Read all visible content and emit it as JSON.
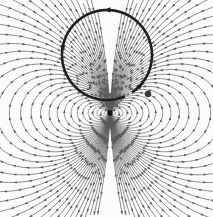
{
  "figure": {
    "title": "Magnetic field of a circular current loop (dipole field)",
    "width": 213,
    "height": 217,
    "background_color": "#fbfbfa",
    "line_color": "#5a5a5a",
    "heavy_line_color": "#1a1a1a",
    "marker_color": "#111111"
  },
  "current_loop": {
    "name": "current-loop",
    "center_x": 107,
    "center_y": 55,
    "radius": 45,
    "stroke_width": 2.6,
    "color": "#1f1f1f",
    "gap_start_deg": 55,
    "gap_end_deg": 68,
    "direction": "clockwise-viewed-from-front",
    "arrow_count": 3,
    "arrow_angles_deg": [
      268,
      186,
      40
    ]
  },
  "dipole_marker": {
    "name": "dipole-center-marker",
    "x": 110,
    "y": 113,
    "size": 5,
    "shape": "square",
    "color": "#111111"
  },
  "loop_end_marker": {
    "name": "loop-end-cap",
    "x": 148,
    "y": 94,
    "radius": 3.2,
    "color": "#3a3a3a"
  },
  "field_lines": {
    "name": "magnetic-field-lines",
    "stroke_width": 0.75,
    "color": "#5b5b5b",
    "arrowhead_length": 3.4,
    "arrowhead_width": 2.4,
    "inner_loop_count": 11,
    "outer_line_count": 26,
    "description": "Nested closed dipole loops around the center with arrowheads indicating field direction; outer lines fan out to the image edges."
  },
  "chart_data": {
    "type": "line",
    "title": "Magnetic field of a circular current loop (dipole field)",
    "xlabel": "",
    "ylabel": "",
    "xlim": [
      -1.07,
      1.06
    ],
    "ylim": [
      -1.04,
      1.13
    ],
    "grid": false,
    "legend": null,
    "annotations": [
      {
        "label": "current loop",
        "x": 107,
        "y": 55,
        "kind": "circle-arc"
      },
      {
        "label": "dipole center",
        "x": 110,
        "y": 113,
        "kind": "point-marker"
      }
    ],
    "series": [
      {
        "name": "dipole-loop-01",
        "alpha": 0.03
      },
      {
        "name": "dipole-loop-02",
        "alpha": 0.06
      },
      {
        "name": "dipole-loop-03",
        "alpha": 0.095
      },
      {
        "name": "dipole-loop-04",
        "alpha": 0.135
      },
      {
        "name": "dipole-loop-05",
        "alpha": 0.18
      },
      {
        "name": "dipole-loop-06",
        "alpha": 0.23
      },
      {
        "name": "dipole-loop-07",
        "alpha": 0.285
      },
      {
        "name": "dipole-loop-08",
        "alpha": 0.345
      },
      {
        "name": "dipole-loop-09",
        "alpha": 0.41
      },
      {
        "name": "dipole-loop-10",
        "alpha": 0.48
      },
      {
        "name": "dipole-loop-11",
        "alpha": 0.555
      },
      {
        "name": "dipole-open-01",
        "alpha": 0.64
      },
      {
        "name": "dipole-open-02",
        "alpha": 0.73
      },
      {
        "name": "dipole-open-03",
        "alpha": 0.83
      },
      {
        "name": "dipole-open-04",
        "alpha": 0.94
      },
      {
        "name": "dipole-open-05",
        "alpha": 1.06
      },
      {
        "name": "dipole-open-06",
        "alpha": 1.19
      },
      {
        "name": "dipole-open-07",
        "alpha": 1.34
      },
      {
        "name": "dipole-open-08",
        "alpha": 1.5
      },
      {
        "name": "dipole-open-09",
        "alpha": 1.69
      },
      {
        "name": "dipole-open-10",
        "alpha": 1.9
      },
      {
        "name": "dipole-open-11",
        "alpha": 2.15
      },
      {
        "name": "dipole-open-12",
        "alpha": 2.45
      },
      {
        "name": "dipole-open-13",
        "alpha": 2.8
      },
      {
        "name": "dipole-open-14",
        "alpha": 3.2
      },
      {
        "name": "dipole-open-15",
        "alpha": 3.7
      },
      {
        "name": "dipole-open-16",
        "alpha": 4.3
      },
      {
        "name": "dipole-open-17",
        "alpha": 5.1
      },
      {
        "name": "dipole-open-18",
        "alpha": 6.1
      },
      {
        "name": "dipole-open-19",
        "alpha": 7.4
      },
      {
        "name": "dipole-open-20",
        "alpha": 9.2
      },
      {
        "name": "dipole-open-21",
        "alpha": 11.8
      },
      {
        "name": "dipole-open-22",
        "alpha": 15.5
      },
      {
        "name": "dipole-open-23",
        "alpha": 21.0
      },
      {
        "name": "dipole-open-24",
        "alpha": 30.0
      },
      {
        "name": "dipole-open-25",
        "alpha": 45.0
      },
      {
        "name": "dipole-open-26",
        "alpha": 75.0
      }
    ]
  }
}
